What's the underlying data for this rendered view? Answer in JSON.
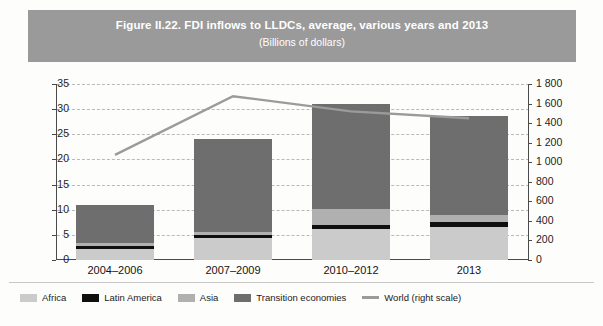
{
  "figure": {
    "title": "Figure II.22. FDI inflows to LLDCs, average, various years and 2013",
    "subtitle": "(Billions of dollars)"
  },
  "chart_data": {
    "type": "bar",
    "title": "Figure II.22. FDI inflows to LLDCs, average, various years and 2013",
    "subtitle": "(Billions of dollars)",
    "xlabel": "",
    "ylabel": "",
    "categories": [
      "2004–2006",
      "2007–2009",
      "2010–2012",
      "2013"
    ],
    "stacked": true,
    "ylim": [
      0,
      35
    ],
    "yticks": [
      0,
      5,
      10,
      15,
      20,
      25,
      30,
      35
    ],
    "y2lim": [
      0,
      1800
    ],
    "y2ticks": [
      0,
      200,
      400,
      600,
      800,
      "1 000",
      "1 200",
      "1 400",
      "1 600",
      "1 800"
    ],
    "y2ticks_numeric": [
      0,
      200,
      400,
      600,
      800,
      1000,
      1200,
      1400,
      1600,
      1800
    ],
    "grid": true,
    "legend_position": "bottom",
    "series": [
      {
        "name": "Africa",
        "color": "#cbcbcb",
        "values": [
          2.2,
          4.3,
          6.1,
          6.6
        ]
      },
      {
        "name": "Latin America",
        "color": "#0f0f0f",
        "values": [
          0.5,
          0.6,
          0.9,
          1.0
        ]
      },
      {
        "name": "Asia",
        "color": "#b0b0b0",
        "values": [
          0.6,
          0.7,
          3.2,
          1.3
        ]
      },
      {
        "name": "Transition economies",
        "color": "#6e6e6e",
        "values": [
          7.6,
          18.4,
          20.9,
          19.7
        ]
      },
      {
        "name": "World (right scale)",
        "color": "#9b9b9b",
        "values": [
          1075,
          1675,
          1520,
          1450
        ],
        "axis": "right",
        "type": "line"
      }
    ],
    "totals": [
      10.9,
      24.0,
      31.1,
      28.6
    ]
  },
  "legend": [
    {
      "label": "Africa",
      "color": "#cbcbcb",
      "kind": "box"
    },
    {
      "label": "Latin America",
      "color": "#0f0f0f",
      "kind": "box"
    },
    {
      "label": "Asia",
      "color": "#b0b0b0",
      "kind": "box"
    },
    {
      "label": "Transition economies",
      "color": "#6e6e6e",
      "kind": "box"
    },
    {
      "label": "World (right scale)",
      "color": "#9b9b9b",
      "kind": "line"
    }
  ]
}
